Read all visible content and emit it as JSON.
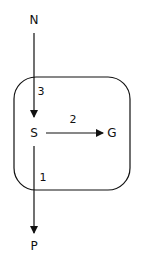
{
  "nodes": [
    {
      "id": "N",
      "label": "N"
    },
    {
      "id": "S",
      "label": "S"
    },
    {
      "id": "G",
      "label": "G"
    },
    {
      "id": "P",
      "label": "P"
    }
  ],
  "edges": [
    {
      "from": "N",
      "to": "S",
      "label": "3"
    },
    {
      "from": "S",
      "to": "G",
      "label": "2"
    },
    {
      "from": "S",
      "to": "P",
      "label": "1"
    }
  ],
  "colors": {
    "stroke": "#111111",
    "background": "#ffffff"
  }
}
